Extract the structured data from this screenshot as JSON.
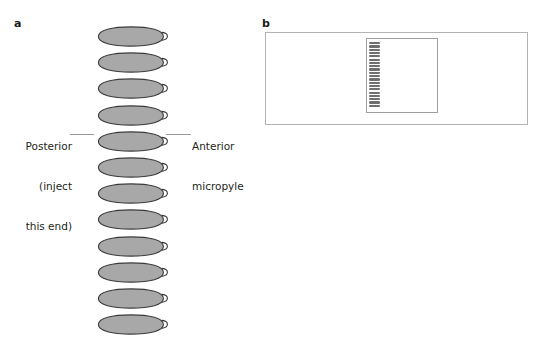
{
  "figure": {
    "panels": [
      {
        "letter": "a",
        "name": "egg-alignment-diagram",
        "egg_count": 12,
        "egg_fill": "#a8a8a8",
        "egg_stroke": "#3a3a3a",
        "annotations": [
          {
            "name": "posterior-label",
            "lines": [
              "Posterior",
              "(inject",
              "this end)"
            ],
            "side": "left"
          },
          {
            "name": "anterior-label",
            "lines": [
              "Anterior",
              "micropyle"
            ],
            "side": "right"
          }
        ]
      },
      {
        "letter": "b",
        "name": "slide-coverslip-diagram",
        "mini_egg_count": 20,
        "slide_stroke": "#b3b3b3",
        "coverslip_stroke": "#9e9e9e",
        "mini_egg_fill": "#6f6f6f"
      }
    ],
    "caption": ""
  }
}
